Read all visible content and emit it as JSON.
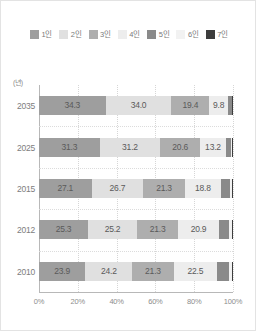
{
  "figure": {
    "y_axis_unit": "(년)",
    "background": "#ffffff",
    "border_color": "#e3e3e3"
  },
  "legend": {
    "position": "top",
    "items": [
      {
        "label": "1인",
        "color": "#9e9e9e"
      },
      {
        "label": "2인",
        "color": "#e0e0e0"
      },
      {
        "label": "3인",
        "color": "#aeaeae"
      },
      {
        "label": "4인",
        "color": "#ededed"
      },
      {
        "label": "5인",
        "color": "#8a8a8a"
      },
      {
        "label": "6인",
        "color": "#f2f2f2"
      },
      {
        "label": "7인",
        "color": "#3d3d3d"
      }
    ]
  },
  "chart_data": {
    "type": "bar",
    "orientation": "horizontal",
    "stacked": true,
    "stack_total": 100,
    "title": "",
    "subtitle": "",
    "xlabel": "",
    "ylabel": "(년)",
    "xlim": [
      0,
      100
    ],
    "grid": true,
    "legend_position": "top",
    "categories": [
      "2035",
      "2025",
      "2015",
      "2012",
      "2010"
    ],
    "xticks": [
      0,
      20,
      40,
      60,
      80,
      100
    ],
    "xticklabels": [
      "0%",
      "20%",
      "40%",
      "60%",
      "80%",
      "100%"
    ],
    "series": [
      {
        "name": "1인",
        "color": "#9e9e9e",
        "values": [
          34.3,
          31.3,
          27.1,
          25.3,
          23.9
        ]
      },
      {
        "name": "2인",
        "color": "#e0e0e0",
        "values": [
          34.0,
          31.2,
          26.7,
          25.2,
          24.2
        ]
      },
      {
        "name": "3인",
        "color": "#aeaeae",
        "values": [
          19.4,
          20.6,
          21.3,
          21.3,
          21.3
        ]
      },
      {
        "name": "4인",
        "color": "#ededed",
        "values": [
          9.8,
          13.2,
          18.8,
          20.9,
          22.5
        ]
      },
      {
        "name": "5인",
        "color": "#8a8a8a",
        "values": [
          1.8,
          2.8,
          4.6,
          5.5,
          6.2
        ]
      },
      {
        "name": "6인",
        "color": "#f2f2f2",
        "values": [
          0.4,
          0.6,
          1.0,
          1.3,
          1.4
        ]
      },
      {
        "name": "7인",
        "color": "#3d3d3d",
        "values": [
          0.3,
          0.3,
          0.5,
          0.5,
          0.5
        ]
      }
    ],
    "bar_value_labels": [
      {
        "category": "2035",
        "labels": [
          "34.3",
          "34.0",
          "19.4",
          "9.8",
          "",
          "",
          ""
        ]
      },
      {
        "category": "2025",
        "labels": [
          "31.3",
          "31.2",
          "20.6",
          "13.2",
          "",
          "",
          ""
        ]
      },
      {
        "category": "2015",
        "labels": [
          "27.1",
          "26.7",
          "21.3",
          "18.8",
          "",
          "",
          ""
        ]
      },
      {
        "category": "2012",
        "labels": [
          "25.3",
          "25.2",
          "21.3",
          "20.9",
          "",
          "",
          ""
        ]
      },
      {
        "category": "2010",
        "labels": [
          "23.9",
          "24.2",
          "21.3",
          "22.5",
          "",
          "",
          ""
        ]
      }
    ]
  }
}
